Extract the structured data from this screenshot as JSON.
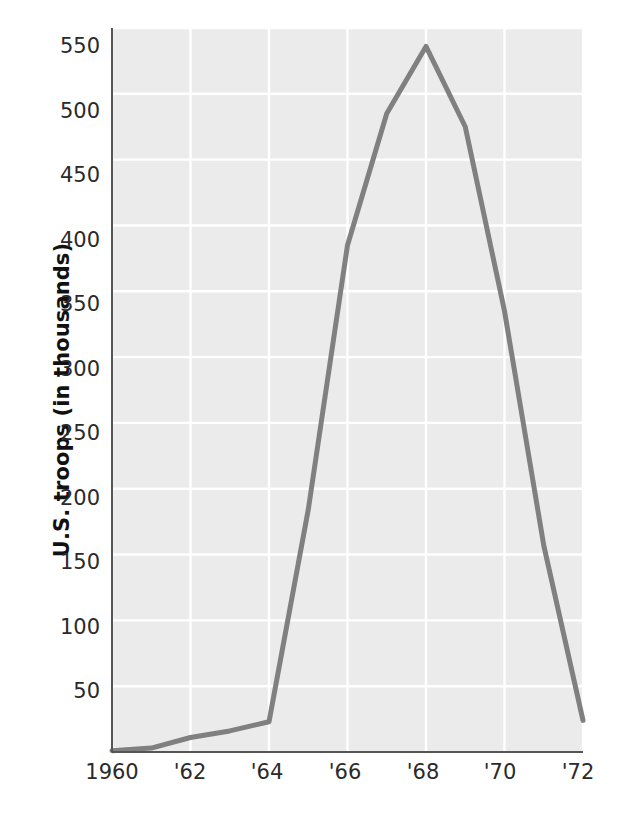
{
  "chart_data": {
    "type": "line",
    "title": "",
    "xlabel": "",
    "ylabel": "U.S. troops (in thousands)",
    "x": [
      1960,
      1961,
      1962,
      1963,
      1964,
      1965,
      1966,
      1967,
      1968,
      1969,
      1970,
      1971,
      1972
    ],
    "values": [
      1,
      3,
      11,
      16,
      23,
      184,
      385,
      485,
      536,
      475,
      335,
      157,
      24
    ],
    "series": [
      {
        "name": "U.S. troops in Vietnam",
        "values": [
          1,
          3,
          11,
          16,
          23,
          184,
          385,
          485,
          536,
          475,
          335,
          157,
          24
        ]
      }
    ],
    "xtick_labels": [
      "1960",
      "'62",
      "'64",
      "'66",
      "'68",
      "'70",
      "'72"
    ],
    "xtick_values": [
      1960,
      1962,
      1964,
      1966,
      1968,
      1970,
      1972
    ],
    "ytick_labels": [
      "50",
      "100",
      "150",
      "200",
      "250",
      "300",
      "350",
      "400",
      "450",
      "500",
      "550"
    ],
    "ytick_values": [
      50,
      100,
      150,
      200,
      250,
      300,
      350,
      400,
      450,
      500,
      550
    ],
    "xlim": [
      1960,
      1972
    ],
    "ylim": [
      0,
      550
    ],
    "grid": true,
    "legend": "none",
    "colors": {
      "line": "#808080",
      "plot_background": "#ebebeb",
      "gridline": "#ffffff",
      "axis": "#555555",
      "tick_text": "#2a2a2a",
      "axis_label": "#111111"
    }
  }
}
